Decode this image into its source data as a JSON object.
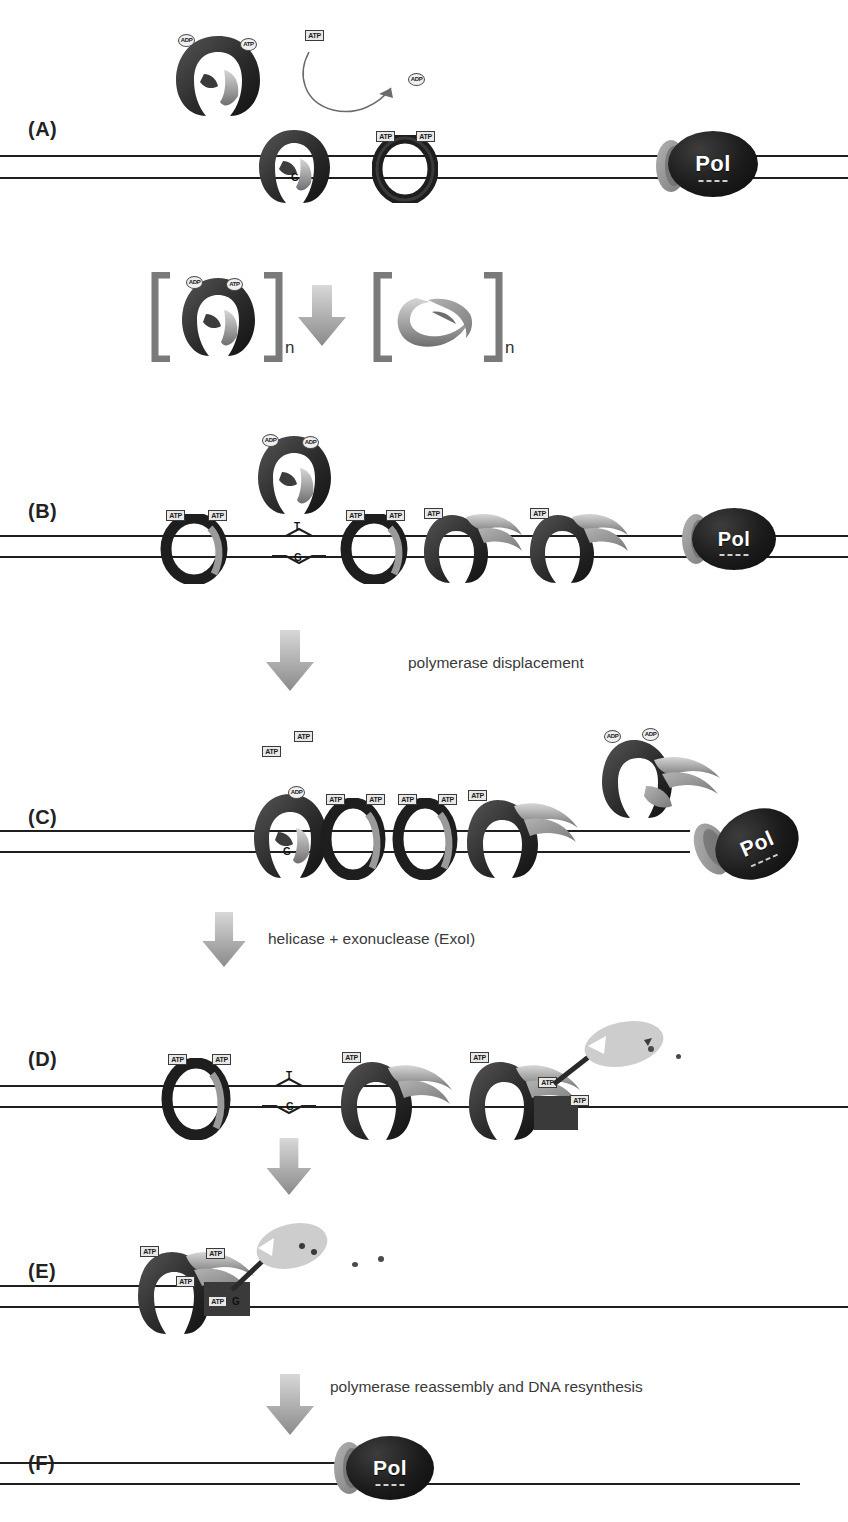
{
  "figure": {
    "background": "#ffffff",
    "colors": {
      "loader_dark": "#2e2e2e",
      "clamp_gray": "#8d8d8d",
      "clamp_light": "#b9b9b9",
      "dna": "#1f1f1f",
      "pol_fill": "#151515",
      "pol_text": "#ffffff",
      "arrow_gray": "#9a9a9a",
      "bracket_gray": "#7a7a7a",
      "exonuclease": "#c9c9c9",
      "text": "#3a3a3a"
    }
  },
  "panels": [
    {
      "id": "A",
      "label": "(A)"
    },
    {
      "id": "B",
      "label": "(B)"
    },
    {
      "id": "C",
      "label": "(C)"
    },
    {
      "id": "D",
      "label": "(D)"
    },
    {
      "id": "E",
      "label": "(E)"
    },
    {
      "id": "F",
      "label": "(F)"
    }
  ],
  "transitions": [
    {
      "id": "t1",
      "label": "polymerase displacement"
    },
    {
      "id": "t2",
      "label": "helicase + exonuclease (ExoI)"
    },
    {
      "id": "t3",
      "label": "polymerase reassembly and DNA resynthesis"
    }
  ],
  "equation": {
    "left_subscript": "n",
    "right_subscript": "n",
    "left_species": "clamp-loader-with-ATP",
    "right_species": "sliding-clamp"
  },
  "nucleotides": {
    "atp": "ATP",
    "adp": "ADP"
  },
  "mismatch": {
    "top_base": "T",
    "bottom_base": "G"
  },
  "polymerase": {
    "label": "Pol"
  },
  "panel_a": {
    "free_loader_tags": [
      "ADP",
      "ATP"
    ],
    "bound_loader_tags": [],
    "ring_tags": [
      "ATP",
      "ATP"
    ],
    "released_nucleotide": "ADP",
    "incoming_nucleotide": "ATP",
    "mismatch_base": "G"
  },
  "panel_b": {
    "free_loader_tags": [
      "ADP",
      "ADP"
    ],
    "ring_tags_1": [
      "ATP",
      "ATP"
    ],
    "ring_tags_2": [
      "ATP",
      "ATP"
    ],
    "ring_tags_3": [
      "ATP"
    ],
    "ring_tags_4": [
      "ATP"
    ],
    "mismatch": [
      "T",
      "G"
    ]
  },
  "panel_c": {
    "floating": [
      "ATP",
      "ATP"
    ],
    "loader_tags": [
      "ADP",
      "ADP"
    ],
    "ring_tags": [
      "ADP",
      "ATP",
      "ATP",
      "ATP",
      "ATP",
      "ATP"
    ],
    "mismatch_base": "G"
  },
  "panel_d": {
    "ring_tags_1": [
      "ATP",
      "ATP"
    ],
    "ring_tags_2": [
      "ATP"
    ],
    "ring_tags_3": [
      "ATP",
      "ATP",
      "ATP"
    ],
    "mismatch": [
      "T",
      "G"
    ]
  },
  "panel_e": {
    "ring_tags": [
      "ATP",
      "ATP",
      "ATP",
      "ATP"
    ],
    "mismatch_base": "G"
  }
}
